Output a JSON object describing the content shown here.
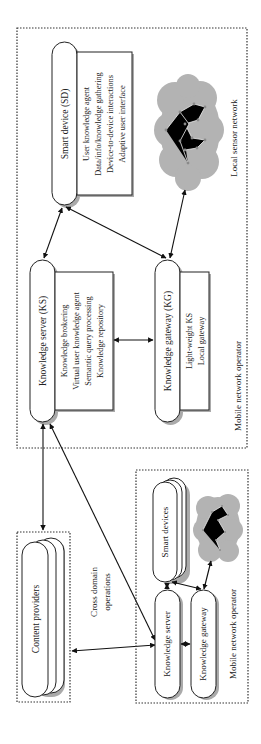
{
  "diagram": {
    "top_panel": {
      "label": "Mobile network operator",
      "smart_device": {
        "title": "Smart device (SD)",
        "functions": [
          "User knowledge agent",
          "Data/info/knowledge gathering",
          "Device-to-device interactions",
          "Adaptive user interface"
        ]
      },
      "local_sensor_network": {
        "label": "Local sensor network",
        "icon": "cloud-network-icon"
      },
      "knowledge_server": {
        "title": "Knowledge server (KS)",
        "functions": [
          "Knowledge brokering",
          "Virtual user knowledge agent",
          "Semantic query processing",
          "Knowledge repository"
        ]
      },
      "knowledge_gateway": {
        "title": "Knowledge gateway (KG)",
        "functions": [
          "Light-weight KS",
          "Local gateway"
        ]
      }
    },
    "content_providers": {
      "label": "Content providers"
    },
    "cross_domain": {
      "line1": "Cross domain",
      "line2": "operations"
    },
    "bottom_panel": {
      "label": "Mobile network operator",
      "smart_devices": "Smart devices",
      "knowledge_server": "Knowledge server",
      "knowledge_gateway": "Knowledge gateway"
    },
    "colors": {
      "line": "#222222",
      "cloud": "#b3b3b3",
      "background": "#ffffff"
    }
  }
}
